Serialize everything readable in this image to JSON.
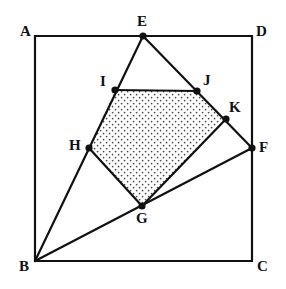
{
  "figure": {
    "type": "geometry-diagram",
    "canvas": {
      "width": 286,
      "height": 289
    },
    "colors": {
      "stroke": "#111111",
      "background": "#ffffff",
      "shading_dot": "#4a4a4a",
      "vertex_fill": "#111111"
    },
    "stroke_width": 2.2,
    "vertex_radius": 3.6,
    "points": [
      {
        "id": "A",
        "label": "A",
        "x": 35,
        "y": 36,
        "on_square": true,
        "marked": false,
        "label_x": 20,
        "label_y": 24
      },
      {
        "id": "D",
        "label": "D",
        "x": 252,
        "y": 36,
        "on_square": true,
        "marked": false,
        "label_x": 256,
        "label_y": 24
      },
      {
        "id": "B",
        "label": "B",
        "x": 35,
        "y": 261,
        "on_square": true,
        "marked": false,
        "label_x": 19,
        "label_y": 259
      },
      {
        "id": "C",
        "label": "C",
        "x": 252,
        "y": 261,
        "on_square": true,
        "marked": false,
        "label_x": 257,
        "label_y": 259
      },
      {
        "id": "E",
        "label": "E",
        "x": 143,
        "y": 36,
        "on_square": true,
        "marked": true,
        "label_x": 137,
        "label_y": 14
      },
      {
        "id": "F",
        "label": "F",
        "x": 252,
        "y": 148,
        "on_square": true,
        "marked": true,
        "label_x": 259,
        "label_y": 140
      },
      {
        "id": "G",
        "label": "G",
        "x": 142,
        "y": 206,
        "on_square": false,
        "marked": true,
        "label_x": 136,
        "label_y": 211
      },
      {
        "id": "H",
        "label": "H",
        "x": 89,
        "y": 148,
        "on_square": false,
        "marked": true,
        "label_x": 69,
        "label_y": 138
      },
      {
        "id": "I",
        "label": "I",
        "x": 115,
        "y": 90,
        "on_square": false,
        "marked": true,
        "label_x": 100,
        "label_y": 74
      },
      {
        "id": "J",
        "label": "J",
        "x": 197,
        "y": 91,
        "on_square": false,
        "marked": true,
        "label_x": 203,
        "label_y": 73
      },
      {
        "id": "K",
        "label": "K",
        "x": 226,
        "y": 119,
        "on_square": false,
        "marked": true,
        "label_x": 229,
        "label_y": 100
      }
    ],
    "square": {
      "name": "square-ABCD",
      "vertices": [
        "A",
        "D",
        "C",
        "B"
      ],
      "path": "M 35 36 L 252 36 L 252 261 L 35 261 Z"
    },
    "segments": [
      {
        "name": "segment-B-E",
        "from": "B",
        "to": "E",
        "path": "M 35 261 L 143 36"
      },
      {
        "name": "segment-B-F",
        "from": "B",
        "to": "F",
        "path": "M 35 261 L 252 148"
      },
      {
        "name": "segment-E-F",
        "from": "E",
        "to": "F",
        "path": "M 143 36 L 252 148"
      },
      {
        "name": "segment-H-G",
        "from": "H",
        "to": "G",
        "path": "M 89 148 L 142 206"
      },
      {
        "name": "segment-G-K",
        "from": "G",
        "to": "K",
        "path": "M 142 206 L 226 119"
      },
      {
        "name": "segment-I-J",
        "from": "I",
        "to": "J",
        "path": "M 115 90 L 197 91"
      }
    ],
    "shaded_region": {
      "name": "pentagon-IJKGH",
      "vertices": [
        "I",
        "J",
        "K",
        "G",
        "H"
      ],
      "path": "M 115 90 L 197 91 L 226 119 L 142 206 L 89 148 Z",
      "fill_pattern": "dotted",
      "dot_spacing": 6,
      "dot_radius": 0.85
    }
  }
}
